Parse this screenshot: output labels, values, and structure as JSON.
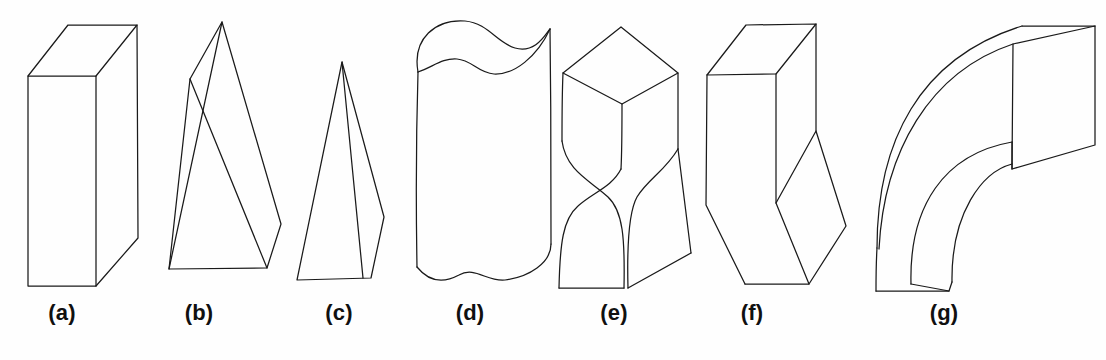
{
  "figure": {
    "background_color": "#fefefe",
    "stroke_color": "#1a1a1a",
    "width": 1106,
    "height": 360,
    "caption_color": "#101010",
    "panels": [
      {
        "id": "a",
        "label": "(a)",
        "shape_name": "rectangular-box",
        "description": "Rectangular prism (cuboid) drawn in oblique projection",
        "label_center_x": 62
      },
      {
        "id": "b",
        "label": "(b)",
        "shape_name": "slanted-wedge",
        "description": "Slanted triangular wedge / oblique prism",
        "label_center_x": 199
      },
      {
        "id": "c",
        "label": "(c)",
        "shape_name": "tall-pyramid",
        "description": "Tall narrow pyramid with apex at top",
        "label_center_x": 339
      },
      {
        "id": "d",
        "label": "(d)",
        "shape_name": "wavy-cross-section-extrusion",
        "description": "Vertical extrusion with wavy closed top face",
        "label_center_x": 470
      },
      {
        "id": "e",
        "label": "(e)",
        "shape_name": "twisted-prism",
        "description": "Square prism twisted about its vertical axis",
        "label_center_x": 614
      },
      {
        "id": "f",
        "label": "(f)",
        "shape_name": "bent-box",
        "description": "Box with a kink / bend in its lower half",
        "label_center_x": 752
      },
      {
        "id": "g",
        "label": "(g)",
        "shape_name": "curved-elbow",
        "description": "Swept curved elbow with square cross-section",
        "label_center_x": 944
      }
    ]
  },
  "geometry": {
    "a": {
      "front_face": "M 28 75 L 96 75 L 96 285 L 28 285 Z",
      "top_face": "M 28 75 L 68 25 L 137 25 L 96 75",
      "right_face": "M 96 75 L 137 25 L 137 237 L 96 285",
      "right_outline": "M 137 25 L 137 237 L 96 285"
    },
    "b": {
      "outline": "M 222 22 L 169 268 L 266 267 L 280 224 Z",
      "crease": "M 222 22 L 189 79 L 266 267",
      "left_edge": "M 189 79 L 169 268"
    },
    "c": {
      "outline": "M 341 63 L 297 279 L 370 277 L 383 217 Z",
      "crease": "M 341 63 L 362 277",
      "left_ridge": "M 341 63 L 297 279"
    },
    "d": {
      "top_curve": "M 418 71 C 414 36 438 20 466 22 C 489 24 498 44 516 49 C 537 55 546 32 549 30",
      "top_curve_front": "M 418 71 C 432 66 441 58 456 59 C 471 60 477 72 493 73 C 512 74 536 58 549 30",
      "left_side": "M 418 71 L 417 266",
      "right_side": "M 549 30 L 550 243",
      "bottom_curve": "M 417 266 C 428 281 443 282 458 274 C 474 266 486 281 504 279 C 528 276 550 262 550 243"
    },
    "e": {
      "top_face": "M 563 73 L 621 27 L 677 73 L 621 103 Z",
      "front_left_top": "M 563 73 L 562 140",
      "front_center": "M 621 103 L 621 168",
      "right_top": "M 677 73 L 677 148",
      "twist_left": "M 562 140 C 566 170 590 180 607 196 C 622 210 624 235 623 287",
      "twist_center": "M 621 168 C 613 186 592 192 578 205 C 564 218 560 240 559 287",
      "twist_right": "M 677 148 C 665 170 647 178 636 196 C 627 212 626 248 627 287",
      "right_rear": "M 677 148 C 682 185 688 225 690 252 L 627 287",
      "bottom": "M 559 287 L 623 287 L 690 252"
    },
    "f": {
      "top_face": "M 707 74 L 746 25 L 815 24 L 775 73 Z",
      "front_left": "M 707 74 L 706 204 L 744 283",
      "front_center": "M 775 73 L 775 202",
      "bottom_front": "M 744 283 L 808 283",
      "right_upper": "M 815 24 L 815 130",
      "notch": "M 815 130 L 775 202 L 808 283 L 845 225 L 815 130",
      "bottom_right": "M 808 283 L 845 225"
    },
    "g": {
      "outer_top": "M 878 245 C 878 140 920 60 1022 26",
      "outer_top2": "M 878 245 C 881 148 926 70 1015 42",
      "inner_arc": "M 912 283 C 912 205 946 155 1012 141",
      "inner_arc2": "M 952 281 C 952 212 983 170 1012 162",
      "end_top": "M 1022 26 L 1094 26",
      "end_face": "M 1012 141 L 1094 26 L 1094 145 L 1012 141",
      "end_right": "M 1094 26 L 1094 145 L 1012 168",
      "end_bottom": "M 1012 141 L 1012 168",
      "left_lower": "M 878 245 L 876 290",
      "bottom_face": "M 876 290 L 948 290 L 952 281",
      "lower_right": "M 948 290 L 912 283"
    }
  }
}
